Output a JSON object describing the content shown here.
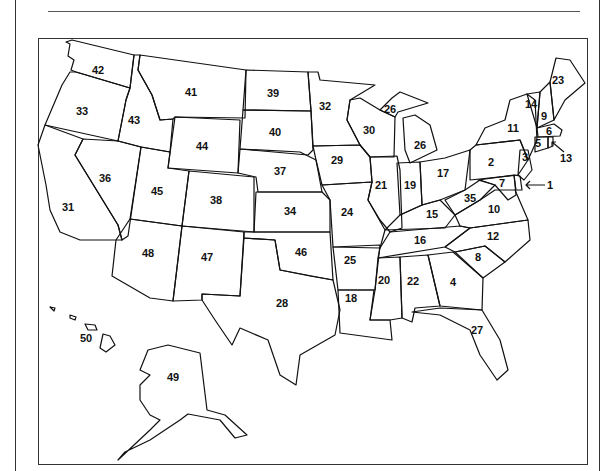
{
  "frame": {
    "rule_color": "#555555",
    "border_color": "#333333"
  },
  "labels": [
    {
      "n": "1",
      "x": 550,
      "y": 185
    },
    {
      "n": "2",
      "x": 491,
      "y": 162
    },
    {
      "n": "3",
      "x": 525,
      "y": 157
    },
    {
      "n": "4",
      "x": 453,
      "y": 282
    },
    {
      "n": "5",
      "x": 538,
      "y": 143
    },
    {
      "n": "6",
      "x": 549,
      "y": 131
    },
    {
      "n": "7",
      "x": 502,
      "y": 183
    },
    {
      "n": "8",
      "x": 478,
      "y": 257
    },
    {
      "n": "9",
      "x": 544,
      "y": 116
    },
    {
      "n": "10",
      "x": 494,
      "y": 209
    },
    {
      "n": "11",
      "x": 513,
      "y": 128
    },
    {
      "n": "12",
      "x": 493,
      "y": 236
    },
    {
      "n": "13",
      "x": 566,
      "y": 158
    },
    {
      "n": "14",
      "x": 531,
      "y": 104
    },
    {
      "n": "15",
      "x": 432,
      "y": 214
    },
    {
      "n": "16",
      "x": 420,
      "y": 240
    },
    {
      "n": "17",
      "x": 443,
      "y": 173
    },
    {
      "n": "18",
      "x": 351,
      "y": 298
    },
    {
      "n": "19",
      "x": 410,
      "y": 185
    },
    {
      "n": "20",
      "x": 384,
      "y": 280
    },
    {
      "n": "21",
      "x": 381,
      "y": 185
    },
    {
      "n": "22",
      "x": 413,
      "y": 281
    },
    {
      "n": "23",
      "x": 558,
      "y": 80
    },
    {
      "n": "24",
      "x": 347,
      "y": 212
    },
    {
      "n": "25",
      "x": 350,
      "y": 260
    },
    {
      "n": "26",
      "x": 390,
      "y": 109
    },
    {
      "n": "26b",
      "x": 420,
      "y": 145
    },
    {
      "n": "27",
      "x": 477,
      "y": 330
    },
    {
      "n": "28",
      "x": 282,
      "y": 303
    },
    {
      "n": "29",
      "x": 337,
      "y": 160
    },
    {
      "n": "30",
      "x": 369,
      "y": 130
    },
    {
      "n": "31",
      "x": 68,
      "y": 207
    },
    {
      "n": "32",
      "x": 325,
      "y": 106
    },
    {
      "n": "33",
      "x": 82,
      "y": 111
    },
    {
      "n": "34",
      "x": 290,
      "y": 211
    },
    {
      "n": "35",
      "x": 470,
      "y": 198
    },
    {
      "n": "36",
      "x": 105,
      "y": 178
    },
    {
      "n": "37",
      "x": 280,
      "y": 171
    },
    {
      "n": "38",
      "x": 216,
      "y": 200
    },
    {
      "n": "39",
      "x": 273,
      "y": 93
    },
    {
      "n": "40",
      "x": 275,
      "y": 132
    },
    {
      "n": "41",
      "x": 191,
      "y": 92
    },
    {
      "n": "42",
      "x": 98,
      "y": 70
    },
    {
      "n": "43",
      "x": 134,
      "y": 120
    },
    {
      "n": "44",
      "x": 202,
      "y": 146
    },
    {
      "n": "45",
      "x": 157,
      "y": 191
    },
    {
      "n": "46",
      "x": 301,
      "y": 252
    },
    {
      "n": "47",
      "x": 207,
      "y": 257
    },
    {
      "n": "48",
      "x": 148,
      "y": 253
    },
    {
      "n": "49",
      "x": 173,
      "y": 377
    },
    {
      "n": "50",
      "x": 86,
      "y": 338
    }
  ],
  "label_text": {
    "1": "1",
    "2": "2",
    "3": "3",
    "4": "4",
    "5": "5",
    "6": "6",
    "7": "7",
    "8": "8",
    "9": "9",
    "10": "10",
    "11": "11",
    "12": "12",
    "13": "13",
    "14": "14",
    "15": "15",
    "16": "16",
    "17": "17",
    "18": "18",
    "19": "19",
    "20": "20",
    "21": "21",
    "22": "22",
    "23": "23",
    "24": "24",
    "25": "25",
    "26": "26",
    "26b": "26",
    "27": "27",
    "28": "28",
    "29": "29",
    "30": "30",
    "31": "31",
    "32": "32",
    "33": "33",
    "34": "34",
    "35": "35",
    "36": "36",
    "37": "37",
    "38": "38",
    "39": "39",
    "40": "40",
    "41": "41",
    "42": "42",
    "43": "43",
    "44": "44",
    "45": "45",
    "46": "46",
    "47": "47",
    "48": "48",
    "49": "49",
    "50": "50"
  }
}
